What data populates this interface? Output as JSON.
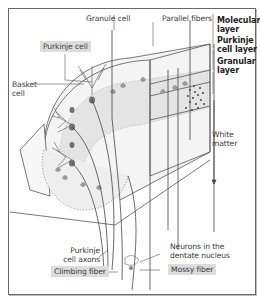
{
  "figure": {
    "labels": {
      "granule_cell": "Granule cell",
      "parallel_fibers": "Parallel fibers",
      "purkinje_cell": "Purkinje cell",
      "basket_cell_1": "Basket",
      "basket_cell_2": "cell",
      "molecular_layer_1": "Molecular",
      "molecular_layer_2": "layer",
      "purkinje_layer_1": "Purkinje",
      "purkinje_layer_2": "cell layer",
      "granular_layer_1": "Granular",
      "granular_layer_2": "layer",
      "white_matter_1": "White",
      "white_matter_2": "matter",
      "purkinje_axons_1": "Purkinje",
      "purkinje_axons_2": "cell axons",
      "climbing_fiber": "Climbing fiber",
      "dentate_1": "Neurons in the",
      "dentate_2": "dentate nucleus",
      "mossy_fiber": "Mossy fiber"
    },
    "highlighted_labels": [
      "Purkinje cell",
      "Climbing fiber",
      "Mossy fiber"
    ],
    "colors": {
      "label_highlight": "#dcdcdc",
      "line": "#444444",
      "layer_fill": "#e6e6e6",
      "cell_fill": "#9a9a9a"
    }
  }
}
